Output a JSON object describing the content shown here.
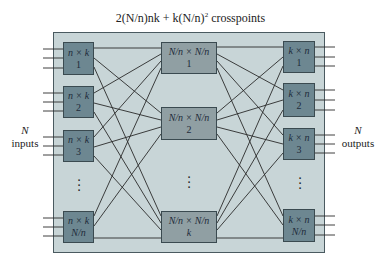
{
  "title": {
    "formula_prefix": "2(",
    "formula_text": "2(N/n)nk + k(N/n)",
    "exponent": "2",
    "suffix": "crosspoints"
  },
  "inputs_label": {
    "n": "N",
    "text": "inputs"
  },
  "outputs_label": {
    "n": "N",
    "text": "outputs"
  },
  "stage1": {
    "boxes": [
      {
        "dims": "n × k",
        "index": "1"
      },
      {
        "dims": "n × k",
        "index": "2"
      },
      {
        "dims": "n × k",
        "index": "3"
      },
      {
        "dims": "n × k",
        "index": "N/n"
      }
    ]
  },
  "stage2": {
    "boxes": [
      {
        "dims": "N/n × N/n",
        "index": "1"
      },
      {
        "dims": "N/n × N/n",
        "index": "2"
      },
      {
        "dims": "N/n × N/n",
        "index": "k"
      }
    ]
  },
  "stage3": {
    "boxes": [
      {
        "dims": "k × n",
        "index": "1"
      },
      {
        "dims": "k × n",
        "index": "2"
      },
      {
        "dims": "k × n",
        "index": "3"
      },
      {
        "dims": "k × n",
        "index": "N/n"
      }
    ]
  },
  "ellipsis": "⋮",
  "colors": {
    "panel": "#c8d5d7",
    "outer_stage_box": "#6d8791",
    "middle_stage_box": "#909fa3",
    "wire": "#2a2a2a"
  }
}
